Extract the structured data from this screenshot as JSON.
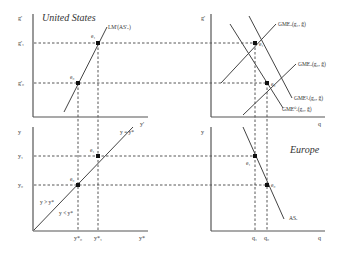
{
  "panels": {
    "top_left": {
      "title": "United States",
      "y_axis_label": "g'",
      "x_axis_label": "y'",
      "y_ticks": [
        "g'₁",
        "g'₀"
      ],
      "curve_label": "LM'(AS'ᵤ)",
      "points": [
        "e₁",
        "e₀"
      ]
    },
    "top_right": {
      "y_axis_label": "g'",
      "x_axis_label": "q",
      "curves": [
        "GMEᵤ(g₁, g̃)",
        "GMEᵤ(g₀, g̃)",
        "GME¹ₑ(g₀, g̃)",
        "GME⁰ₑ(g₀, g̃)"
      ],
      "points": [
        "e₁",
        "e₀"
      ]
    },
    "bottom_left": {
      "y_axis_label": "y",
      "x_axis_label": "y*",
      "y_ticks": [
        "y₁",
        "y₀"
      ],
      "x_ticks": [
        "y*₀",
        "y*₁"
      ],
      "diagonal_label": "y = y*",
      "region_above": "y > y*",
      "region_below": "y < y*",
      "points": [
        "e₁",
        "e₀"
      ]
    },
    "bottom_right": {
      "title": "Europe",
      "y_axis_label": "y",
      "x_axis_label": "q",
      "x_ticks": [
        "q₁",
        "q₀"
      ],
      "curve_label": "ASₑ",
      "points": [
        "e₁",
        "e₀"
      ]
    }
  }
}
